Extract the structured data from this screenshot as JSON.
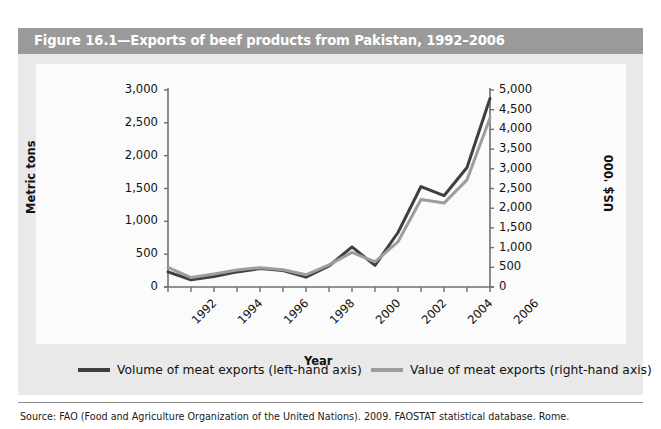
{
  "figure": {
    "title": "Figure 16.1—Exports of beef products from Pakistan, 1992–2006",
    "title_bar_color": "#9a9a9a",
    "panel_color": "#e9e9e9",
    "source": "Source: FAO (Food and Agriculture Organization of the United Nations). 2009. FAOSTAT statistical database. Rome."
  },
  "legend": {
    "position": "bottom",
    "items": [
      {
        "label": "Volume of meat exports (left-hand axis)",
        "color": "#3f3f3f"
      },
      {
        "label": "Value of meat exports (right-hand axis)",
        "color": "#9d9d9d"
      }
    ]
  },
  "chart_data": {
    "type": "line",
    "title": "Figure 16.1—Exports of beef products from Pakistan, 1992–2006",
    "xlabel": "Year",
    "ylabel": "Metric tons",
    "y2label": "US$ '000",
    "grid": false,
    "x": [
      1992,
      1993,
      1994,
      1995,
      1996,
      1997,
      1998,
      1999,
      2000,
      2001,
      2002,
      2003,
      2004,
      2005,
      2006
    ],
    "xtick_labels": [
      "1992",
      "1994",
      "1996",
      "1998",
      "2000",
      "2002",
      "2004",
      "2006"
    ],
    "xtick_values": [
      1992,
      1994,
      1996,
      1998,
      2000,
      2002,
      2004,
      2006
    ],
    "ylim": [
      0,
      3000
    ],
    "yticks": [
      0,
      500,
      1000,
      1500,
      2000,
      2500,
      3000
    ],
    "ytick_labels": [
      "0",
      "500",
      "1,000",
      "1,500",
      "2,000",
      "2,500",
      "3,000"
    ],
    "y2lim": [
      0,
      5000
    ],
    "y2ticks": [
      0,
      500,
      1000,
      1500,
      2000,
      2500,
      3000,
      3500,
      4000,
      4500,
      5000
    ],
    "y2tick_labels": [
      "0",
      "500",
      "1,000",
      "1,500",
      "2,000",
      "2,500",
      "3,000",
      "3,500",
      "4,000",
      "4,500",
      "5,000"
    ],
    "series": [
      {
        "name": "Volume of meat exports (left-hand axis)",
        "axis": "left",
        "unit": "Metric tons",
        "color": "#3f3f3f",
        "values": [
          230,
          110,
          160,
          230,
          280,
          250,
          150,
          320,
          610,
          330,
          830,
          1530,
          1390,
          1820,
          2870
        ]
      },
      {
        "name": "Value of meat exports (right-hand axis)",
        "axis": "right",
        "unit": "US$ '000",
        "color": "#9d9d9d",
        "values": [
          500,
          240,
          330,
          430,
          490,
          440,
          310,
          560,
          880,
          640,
          1150,
          2220,
          2130,
          2720,
          4290
        ]
      }
    ]
  }
}
